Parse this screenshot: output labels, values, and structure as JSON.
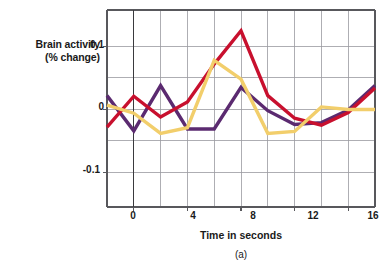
{
  "figure": {
    "caption": "(a)",
    "y_axis_label_line1": "Brain activity",
    "y_axis_label_line2": "(% change)",
    "x_axis_label": "Time in seconds"
  },
  "chart_data": {
    "type": "line",
    "title": "",
    "subtitle": "",
    "caption": "(a)",
    "xlabel": "Time in seconds",
    "ylabel": "Brain activity (% change)",
    "xlim": [
      -2,
      18
    ],
    "ylim": [
      -0.155,
      0.158
    ],
    "xticks": [
      0,
      4,
      8,
      12,
      16
    ],
    "xtick_labels": [
      "0",
      "4",
      "8",
      "12",
      "16"
    ],
    "yticks": [
      0.1,
      0,
      -0.1
    ],
    "ytick_labels": [
      "0.1",
      "0",
      "-0.1"
    ],
    "x_minor_step": 2,
    "y_gridlines": [
      0.1,
      0.05,
      0,
      -0.05,
      -0.1
    ],
    "grid": true,
    "legend": "none",
    "x": [
      -2,
      0,
      2,
      4,
      6,
      8,
      10,
      12,
      14,
      16,
      18
    ],
    "series": [
      {
        "name": "purple-trace",
        "color": "#5B2A70",
        "values": [
          0.022,
          -0.034,
          0.038,
          -0.031,
          -0.031,
          0.035,
          -0.002,
          -0.024,
          -0.021,
          -0.001,
          0.038
        ]
      },
      {
        "name": "red-trace",
        "color": "#C8102E",
        "values": [
          -0.028,
          0.021,
          -0.012,
          0.012,
          0.072,
          0.125,
          0.022,
          -0.014,
          -0.025,
          -0.005,
          0.034
        ]
      },
      {
        "name": "yellow-trace",
        "color": "#F2CE6B",
        "values": [
          0.007,
          -0.006,
          -0.038,
          -0.029,
          0.078,
          0.048,
          -0.038,
          -0.035,
          0.004,
          0.0,
          0.0
        ]
      }
    ],
    "colors": {
      "purple": "#5B2A70",
      "red": "#C8102E",
      "yellow": "#F2CE6B",
      "grid": "#9a9aa0",
      "axis": "#58585c",
      "text": "#1a1a1a",
      "background": "#ffffff"
    }
  }
}
